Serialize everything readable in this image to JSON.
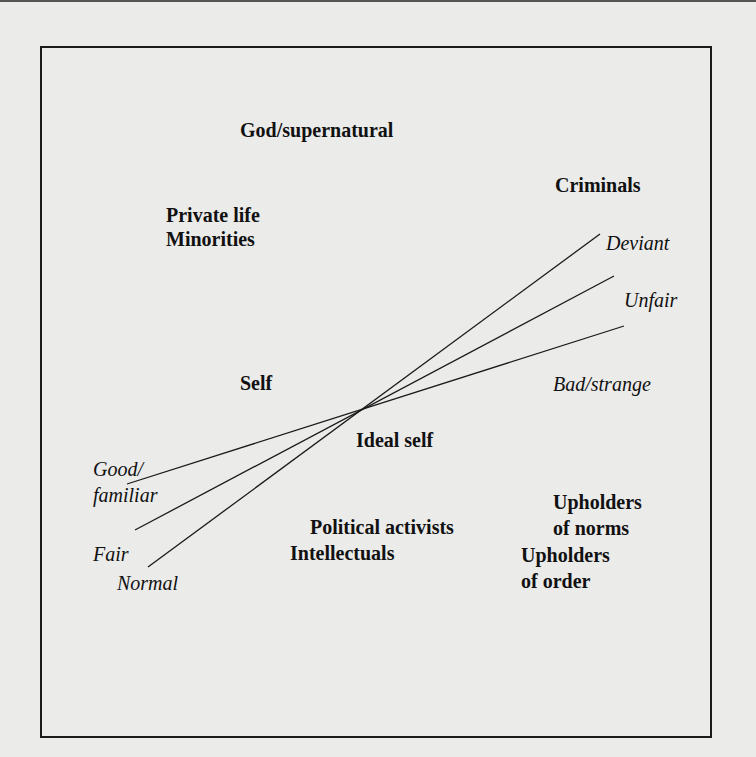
{
  "diagram": {
    "type": "semantic-space with converging dimension lines",
    "groups": {
      "god": "God/supernatural",
      "criminals": "Criminals",
      "private_minorities": [
        "Private life",
        "Minorities"
      ],
      "self": "Self",
      "ideal_self": "Ideal self",
      "activists_intellectuals": [
        "Political activists",
        "Intellectuals"
      ],
      "upholders_norms": [
        "Upholders",
        "of norms"
      ],
      "upholders_order": [
        "Upholders",
        "of order"
      ]
    },
    "dimensions": [
      {
        "negative_pole": "Deviant",
        "positive_pole": "Normal"
      },
      {
        "negative_pole": "Unfair",
        "positive_pole": "Fair"
      },
      {
        "negative_pole": "Bad/strange",
        "positive_pole": "Good/familiar"
      }
    ],
    "pole_labels": {
      "deviant": "Deviant",
      "unfair": "Unfair",
      "bad_strange": "Bad/strange",
      "good_familiar": [
        "Good/",
        "familiar"
      ],
      "fair": "Fair",
      "normal": "Normal"
    },
    "colors": {
      "background": "#ebebea",
      "ink": "#111111"
    }
  }
}
